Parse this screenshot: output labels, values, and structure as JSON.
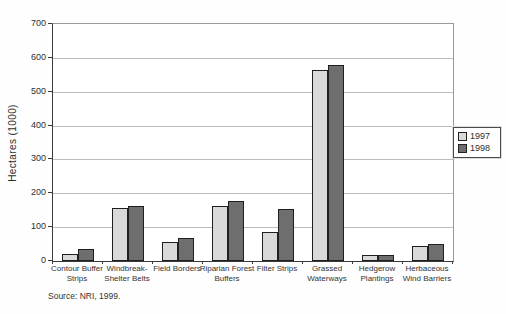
{
  "chart_data": {
    "type": "bar",
    "title": "",
    "xlabel": "",
    "ylabel": "Hectares (1000)",
    "ylim": [
      0,
      700
    ],
    "yticks": [
      0,
      100,
      200,
      300,
      400,
      500,
      600,
      700
    ],
    "grid": "horizontal",
    "legend_position": "right",
    "categories": [
      "Contour Buffer\nStrips",
      "Windbreak-\nShelter Belts",
      "Field Borders",
      "Riparian Forest\nBuffers",
      "Filter Strips",
      "Grassed\nWaterways",
      "Hedgerow\nPlantings",
      "Herbaceous\nWind Barriers"
    ],
    "series": [
      {
        "name": "1997",
        "color": "#d9d9d9",
        "values": [
          22,
          158,
          55,
          163,
          85,
          565,
          17,
          45
        ]
      },
      {
        "name": "1998",
        "color": "#6e6e6e",
        "values": [
          35,
          162,
          67,
          178,
          155,
          580,
          18,
          50
        ]
      }
    ]
  },
  "source_note": "Source: NRI, 1999.",
  "colors": {
    "gridline": "#bdbdbd",
    "axis": "#3a3a3a",
    "bar_border": "#1f1f1f",
    "background": "#fefefe",
    "text": "#2e2e2e"
  }
}
